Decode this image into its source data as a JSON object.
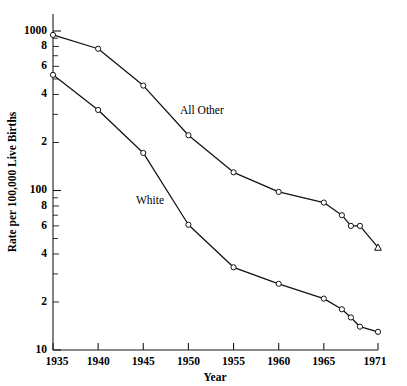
{
  "chart_data": {
    "type": "line",
    "title": "",
    "subtitle": "",
    "xlabel": "Year",
    "ylabel": "Rate per 100,000 Live Births",
    "yscale": "log",
    "xscale": "linear",
    "grid": false,
    "legend_position": "inline-annotation",
    "xlim": [
      1935,
      1971
    ],
    "ylim": [
      10,
      1200
    ],
    "x_tick_labels": [
      "1935",
      "1940",
      "1945",
      "1950",
      "1955",
      "1960",
      "1965",
      "1971"
    ],
    "x_ticks": [
      1935,
      1940,
      1945,
      1950,
      1955,
      1960,
      1965,
      1971
    ],
    "y_tick_labels": [
      "1000",
      "8",
      "6",
      "4",
      "2",
      "100",
      "8",
      "6",
      "4",
      "2",
      "10"
    ],
    "y_ticks": [
      1000,
      800,
      600,
      400,
      200,
      100,
      80,
      60,
      40,
      20,
      10
    ],
    "series": [
      {
        "name": "All Other",
        "label": "All Other",
        "color": "#111111",
        "marker": "circle",
        "x": [
          1935,
          1940,
          1945,
          1950,
          1955,
          1960,
          1965,
          1967,
          1968,
          1969,
          1971
        ],
        "values": [
          945,
          774,
          455,
          222,
          130,
          98,
          84,
          70,
          60,
          60,
          44
        ]
      },
      {
        "name": "White",
        "label": "White",
        "color": "#111111",
        "marker": "circle",
        "x": [
          1935,
          1940,
          1945,
          1950,
          1955,
          1960,
          1965,
          1967,
          1968,
          1969,
          1971
        ],
        "values": [
          531,
          320,
          172,
          61,
          33,
          26,
          21,
          18,
          16,
          14,
          13
        ]
      }
    ],
    "annotations": [
      {
        "text": "All Other",
        "x_px": 180,
        "y_px": 114
      },
      {
        "text": "White",
        "x_px": 136,
        "y_px": 204
      }
    ]
  },
  "axes": {
    "y_title": "Rate per 100,000 Live Births",
    "x_title": "Year"
  }
}
